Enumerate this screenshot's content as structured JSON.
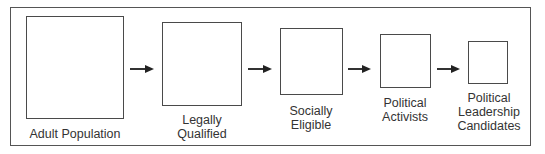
{
  "diagram": {
    "type": "funnel-flow",
    "stages": [
      {
        "label": "Adult Population",
        "lines": [
          "Adult Population"
        ]
      },
      {
        "label": "Legally Qualified",
        "lines": [
          "Legally",
          "Qualified"
        ]
      },
      {
        "label": "Socially Eligible",
        "lines": [
          "Socially",
          "Eligible"
        ]
      },
      {
        "label": "Political Activists",
        "lines": [
          "Political",
          "Activists"
        ]
      },
      {
        "label": "Political Leadership Candidates",
        "lines": [
          "Political",
          "Leadership",
          "Candidates"
        ]
      }
    ],
    "arrows": [
      {
        "from": "Adult Population",
        "to": "Legally Qualified"
      },
      {
        "from": "Legally Qualified",
        "to": "Socially Eligible"
      },
      {
        "from": "Socially Eligible",
        "to": "Political Activists"
      },
      {
        "from": "Political Activists",
        "to": "Political Leadership Candidates"
      }
    ],
    "colors": {
      "stroke": "#4a4a4a",
      "text": "#333333",
      "background": "#ffffff"
    }
  }
}
